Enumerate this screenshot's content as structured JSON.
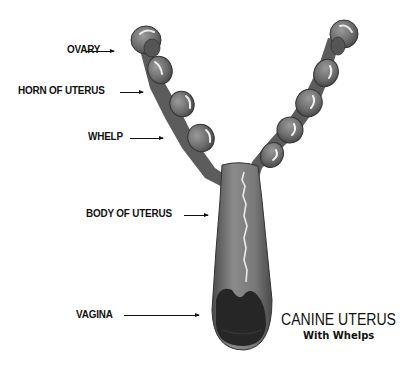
{
  "figure": {
    "title": "CANINE UTERUS",
    "subtitle": "With Whelps",
    "labels": [
      {
        "id": "ovary",
        "text": "OVARY"
      },
      {
        "id": "horn",
        "text": "HORN OF UTERUS"
      },
      {
        "id": "whelp",
        "text": "WHELP"
      },
      {
        "id": "body",
        "text": "BODY OF UTERUS"
      },
      {
        "id": "vagina",
        "text": "VAGINA"
      }
    ],
    "colors": {
      "organ": "#6e6e6e",
      "organ_dark": "#3a3a3a",
      "highlight": "#f2f2f2",
      "opening": "#262626",
      "text": "#111111"
    }
  }
}
